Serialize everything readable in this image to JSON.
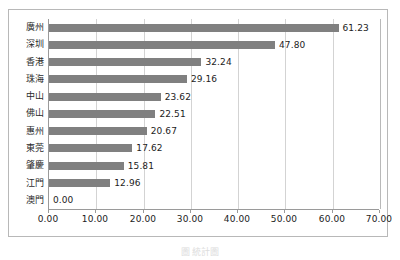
{
  "chart_data": {
    "type": "bar",
    "orientation": "horizontal",
    "title": "",
    "xlabel": "",
    "ylabel": "",
    "categories": [
      "廣州",
      "深圳",
      "香港",
      "珠海",
      "中山",
      "佛山",
      "惠州",
      "東莞",
      "肇慶",
      "江門",
      "澳門"
    ],
    "values": [
      61.23,
      47.8,
      32.24,
      29.16,
      23.62,
      22.51,
      20.67,
      17.62,
      15.81,
      12.96,
      0.0
    ],
    "value_labels": [
      "61.23",
      "47.80",
      "32.24",
      "29.16",
      "23.62",
      "22.51",
      "20.67",
      "17.62",
      "15.81",
      "12.96",
      "0.00"
    ],
    "xlim": [
      0,
      70
    ],
    "xticks": [
      0,
      10,
      20,
      30,
      40,
      50,
      60,
      70
    ],
    "xtick_labels": [
      "0.00",
      "10.00",
      "20.00",
      "30.00",
      "40.00",
      "50.00",
      "60.00",
      "70.00"
    ],
    "grid": true,
    "legend": null,
    "bar_color": "#808080",
    "gridline_color": "#d3d3d3",
    "axis_color": "#9a9a9a",
    "frame_color": "#b8b8b8"
  },
  "caption": {
    "text": "圖  統計圖"
  }
}
